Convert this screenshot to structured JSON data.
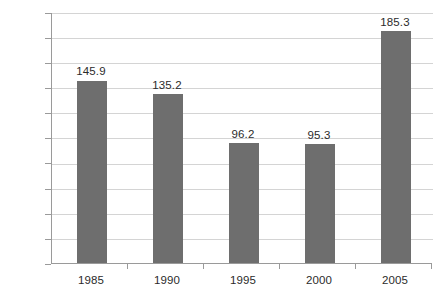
{
  "chart_data": {
    "type": "bar",
    "title": "",
    "subtitle": "",
    "xlabel": "",
    "ylabel": "",
    "categories": [
      "1985",
      "1990",
      "1995",
      "2000",
      "2005"
    ],
    "values": [
      145.9,
      135.2,
      96.2,
      95.3,
      185.3
    ],
    "value_labels": [
      "145.9",
      "135.2",
      "96.2",
      "95.3",
      "185.3"
    ],
    "ylim": [
      0,
      200
    ],
    "ytick_step": 20,
    "ytick_labels": [
      "200",
      "180",
      "160",
      "140",
      "120",
      "100",
      "80",
      "60",
      "40",
      "20",
      "0"
    ],
    "ytick_values": [
      200,
      180,
      160,
      140,
      120,
      100,
      80,
      60,
      40,
      20,
      0
    ],
    "grid": true,
    "grid_axis": "y",
    "legend": false,
    "legend_position": "none",
    "series": [
      {
        "name": "",
        "values": [
          145.9,
          135.2,
          96.2,
          95.3,
          185.3
        ]
      }
    ],
    "colors": {
      "bar": "#6e6e6e",
      "gridline": "#d4d4d4",
      "axis": "#9a9a9a",
      "text": "#2b2b2b",
      "background": "#ffffff"
    }
  }
}
